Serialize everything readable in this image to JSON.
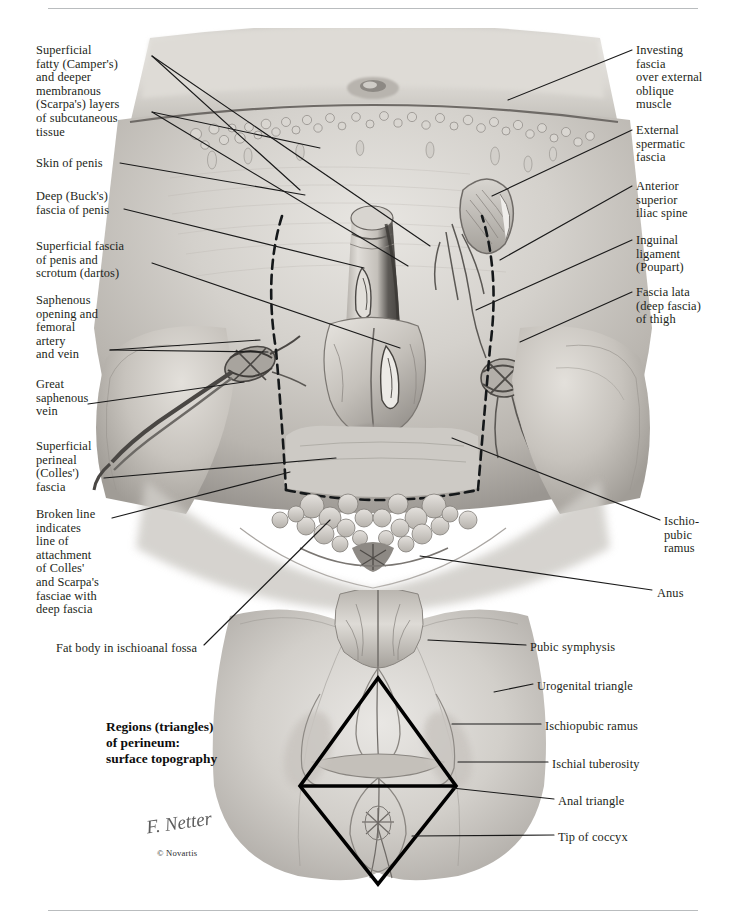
{
  "plate": {
    "title": "Regions (triangles)\nof perineum:\nsurface topography",
    "signature": "F. Netter",
    "copyright": "© Novartis"
  },
  "labels_left": [
    {
      "name": "label-camper-scarpa",
      "text": "Superficial\nfatty (Camper's)\nand deeper\nmembranous\n(Scarpa's) layers\nof subcutaneous\ntissue",
      "x": 36,
      "y": 44
    },
    {
      "name": "label-skin-of-penis",
      "text": "Skin of penis",
      "x": 36,
      "y": 157
    },
    {
      "name": "label-bucks-fascia",
      "text": "Deep (Buck's)\nfascia of penis",
      "x": 36,
      "y": 190
    },
    {
      "name": "label-dartos-fascia",
      "text": "Superficial fascia\nof penis and\nscrotum (dartos)",
      "x": 36,
      "y": 240
    },
    {
      "name": "label-saphenous-opening",
      "text": "Saphenous\nopening and\nfemoral\nartery\nand vein",
      "x": 36,
      "y": 294
    },
    {
      "name": "label-great-saphenous-vein",
      "text": "Great\nsaphenous\nvein",
      "x": 36,
      "y": 378
    },
    {
      "name": "label-colles-fascia",
      "text": "Superficial\nperineal\n(Colles')\nfascia",
      "x": 36,
      "y": 440
    },
    {
      "name": "label-broken-line",
      "text": "Broken line\nindicates\nline of\nattachment\nof Colles'\nand Scarpa's\nfasciae with\ndeep fascia",
      "x": 36,
      "y": 508
    },
    {
      "name": "label-fat-body-ischioanal-fossa",
      "text": "Fat body in ischioanal fossa",
      "x": 56,
      "y": 642
    }
  ],
  "labels_right": [
    {
      "name": "label-investing-fascia",
      "text": "Investing\nfascia\nover external\noblique\nmuscle",
      "x": 636,
      "y": 44
    },
    {
      "name": "label-external-spermatic-fascia",
      "text": "External\nspermatic\nfascia",
      "x": 636,
      "y": 124
    },
    {
      "name": "label-anterior-superior-iliac-spine",
      "text": "Anterior\nsuperior\niliac spine",
      "x": 636,
      "y": 180
    },
    {
      "name": "label-inguinal-ligament",
      "text": "Inguinal\nligament\n(Poupart)",
      "x": 636,
      "y": 234
    },
    {
      "name": "label-fascia-lata",
      "text": "Fascia lata\n(deep fascia)\nof thigh",
      "x": 636,
      "y": 286
    },
    {
      "name": "label-ischiopubic-ramus-upper",
      "text": "Ischio-\npubic\nramus",
      "x": 664,
      "y": 515
    },
    {
      "name": "label-anus",
      "text": "Anus",
      "x": 657,
      "y": 587
    }
  ],
  "labels_lower": [
    {
      "name": "label-pubic-symphysis",
      "text": "Pubic symphysis",
      "x": 530,
      "y": 641
    },
    {
      "name": "label-urogenital-triangle",
      "text": "Urogenital triangle",
      "x": 537,
      "y": 680
    },
    {
      "name": "label-ischiopubic-ramus-lower",
      "text": "Ischiopubic ramus",
      "x": 545,
      "y": 720
    },
    {
      "name": "label-ischial-tuberosity",
      "text": "Ischial tuberosity",
      "x": 552,
      "y": 758
    },
    {
      "name": "label-anal-triangle",
      "text": "Anal triangle",
      "x": 558,
      "y": 795
    },
    {
      "name": "label-tip-of-coccyx",
      "text": "Tip of coccyx",
      "x": 558,
      "y": 831
    }
  ],
  "colors": {
    "leader": "#1a1a1a",
    "rule": "#b9bcbe",
    "text": "#231f20",
    "broken_line": "#15181a",
    "triangle": "#000000"
  }
}
